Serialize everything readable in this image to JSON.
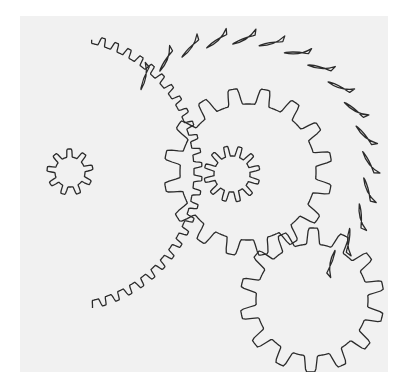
{
  "title": "Gear train diagram",
  "colors": {
    "paper": "#f1f1f1",
    "line": "#2b2b2b",
    "background": "#ffffff"
  },
  "gears": [
    {
      "id": "large-spur-gear",
      "kind": "spur",
      "teeth": 62
    },
    {
      "id": "large-gear-hub-pinion",
      "kind": "spur",
      "teeth": 9
    },
    {
      "id": "ratchet-wheel",
      "kind": "ratchet",
      "teeth": 30
    },
    {
      "id": "middle-spur-gear",
      "kind": "spur",
      "teeth": 16
    },
    {
      "id": "middle-pinion",
      "kind": "spur",
      "teeth": 12
    },
    {
      "id": "lower-spur-gear",
      "kind": "spur",
      "teeth": 14
    }
  ]
}
